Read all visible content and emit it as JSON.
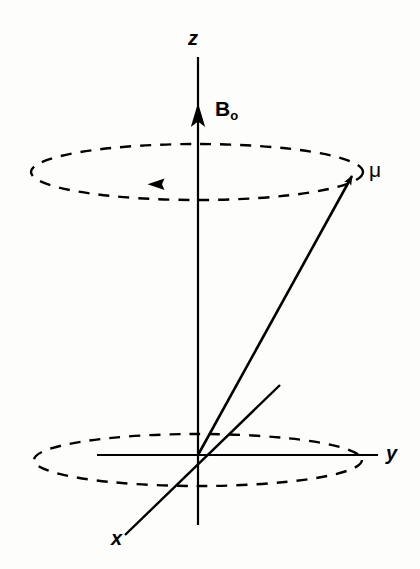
{
  "figure": {
    "kind": "nmr-precession-diagram",
    "background_color": "#fdfdfb",
    "stroke_color": "#000000",
    "labels": {
      "z_axis": "z",
      "y_axis": "y",
      "x_axis": "x",
      "field_symbol": "B",
      "field_subscript": "o",
      "magnetic_moment": "μ"
    },
    "geometry": {
      "origin": [
        198,
        455
      ],
      "z_axis_top": [
        198,
        57
      ],
      "z_axis_bottom": [
        198,
        525
      ],
      "z_arrowhead_tip": [
        198,
        104
      ],
      "y_axis_left": [
        97,
        455
      ],
      "y_axis_right": [
        378,
        455
      ],
      "x_axis_near_end": [
        125,
        535
      ],
      "x_axis_far_end": [
        280,
        385
      ],
      "mu_vector_tip": [
        358,
        170
      ],
      "upper_ellipse_center": [
        197,
        172
      ],
      "upper_ellipse_rx": 166,
      "upper_ellipse_ry": 28,
      "lower_ellipse_center": [
        198,
        460
      ],
      "lower_ellipse_rx": 164,
      "lower_ellipse_ry": 26,
      "precession_arrowhead": [
        155,
        184
      ],
      "precession_direction": "counterclockwise-viewed-from-above"
    },
    "strokes": {
      "axis_width": 2.2,
      "mu_width": 2.6,
      "ellipse_width": 2.4,
      "dash_pattern": "11 9"
    }
  }
}
